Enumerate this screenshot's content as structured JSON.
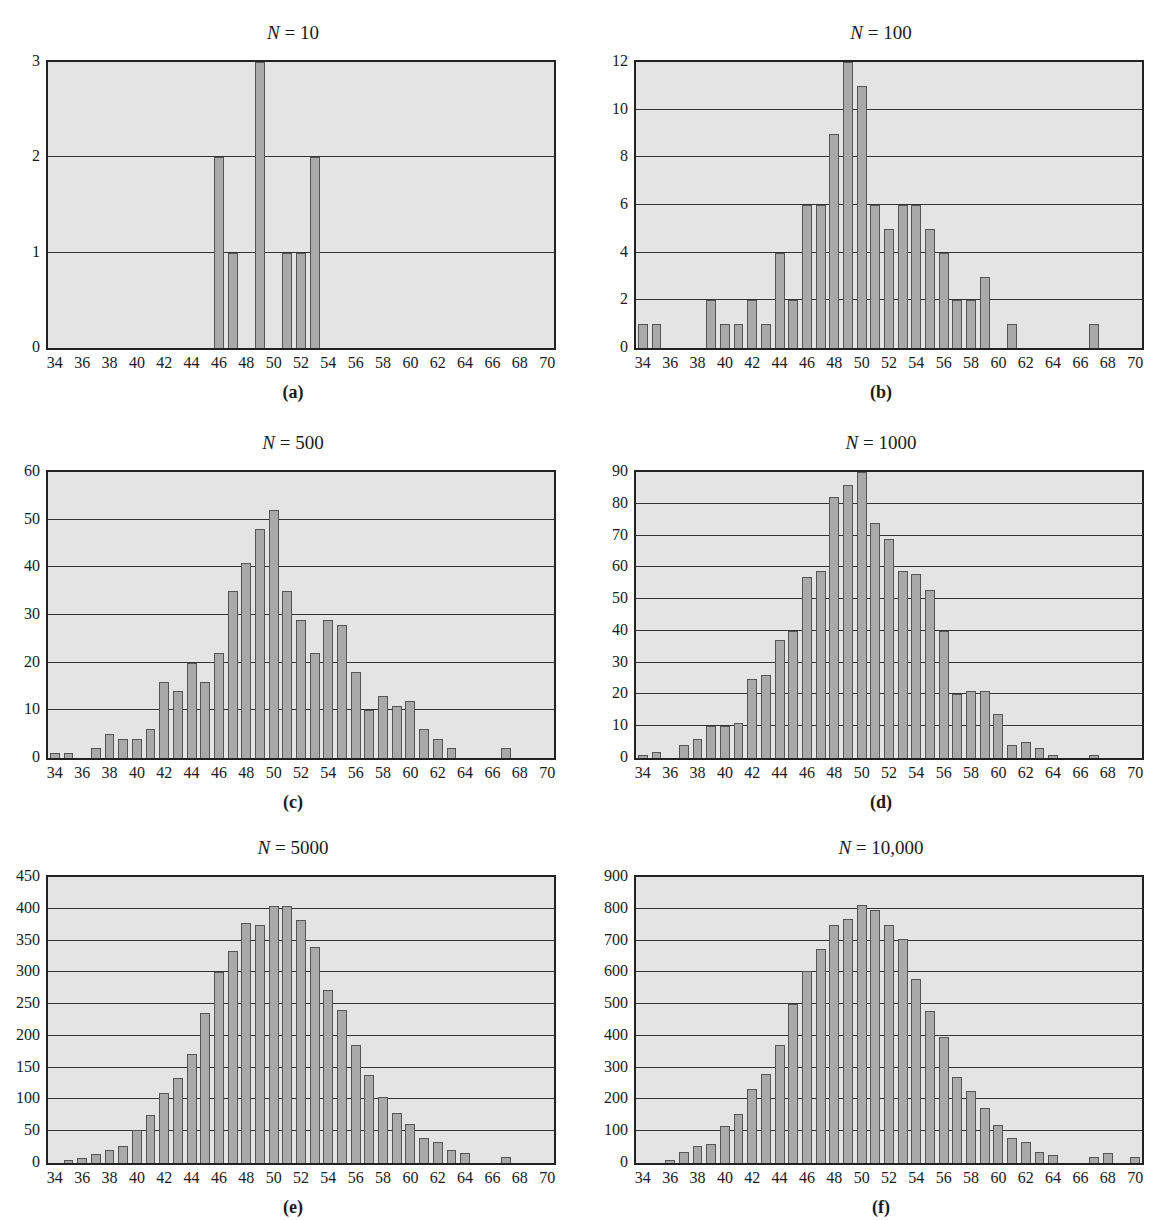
{
  "figure": {
    "panels": [
      {
        "id": "a",
        "label": "(a)",
        "title_var": "N",
        "title_val": "= 10"
      },
      {
        "id": "b",
        "label": "(b)",
        "title_var": "N",
        "title_val": "= 100"
      },
      {
        "id": "c",
        "label": "(c)",
        "title_var": "N",
        "title_val": "= 500"
      },
      {
        "id": "d",
        "label": "(d)",
        "title_var": "N",
        "title_val": "= 1000"
      },
      {
        "id": "e",
        "label": "(e)",
        "title_var": "N",
        "title_val": "= 5000"
      },
      {
        "id": "f",
        "label": "(f)",
        "title_var": "N",
        "title_val": "= 10,000"
      }
    ],
    "colors": {
      "plot_bg": "#e4e4e4",
      "bar_fill": "#a9a9a9",
      "bar_edge": "#555555",
      "grid": "#333333"
    }
  },
  "chart_data": [
    {
      "type": "bar",
      "panel": "(a)",
      "title": "N = 10",
      "xlabel": "",
      "ylabel": "",
      "x_ticks": [
        34,
        36,
        38,
        40,
        42,
        44,
        46,
        48,
        50,
        52,
        54,
        56,
        58,
        60,
        62,
        64,
        66,
        68,
        70
      ],
      "y_ticks": [
        0,
        1,
        2,
        3
      ],
      "ylim": [
        0,
        3
      ],
      "xlim": [
        33.5,
        70.5
      ],
      "grid": "horizontal",
      "categories": [
        46,
        47,
        49,
        51,
        52,
        53
      ],
      "values": [
        2,
        1,
        3,
        1,
        1,
        2
      ]
    },
    {
      "type": "bar",
      "panel": "(b)",
      "title": "N = 100",
      "xlabel": "",
      "ylabel": "",
      "x_ticks": [
        34,
        36,
        38,
        40,
        42,
        44,
        46,
        48,
        50,
        52,
        54,
        56,
        58,
        60,
        62,
        64,
        66,
        68,
        70
      ],
      "y_ticks": [
        0,
        2,
        4,
        6,
        8,
        10,
        12
      ],
      "ylim": [
        0,
        12
      ],
      "xlim": [
        33.5,
        70.5
      ],
      "grid": "horizontal",
      "categories": [
        34,
        35,
        39,
        40,
        41,
        42,
        43,
        44,
        45,
        46,
        47,
        48,
        49,
        50,
        51,
        52,
        53,
        54,
        55,
        56,
        57,
        58,
        59,
        61,
        67
      ],
      "values": [
        1,
        1,
        2,
        1,
        1,
        2,
        1,
        4,
        2,
        6,
        6,
        9,
        12,
        11,
        6,
        5,
        6,
        6,
        5,
        4,
        2,
        2,
        3,
        1,
        1
      ]
    },
    {
      "type": "bar",
      "panel": "(c)",
      "title": "N = 500",
      "xlabel": "",
      "ylabel": "",
      "x_ticks": [
        34,
        36,
        38,
        40,
        42,
        44,
        46,
        48,
        50,
        52,
        54,
        56,
        58,
        60,
        62,
        64,
        66,
        68,
        70
      ],
      "y_ticks": [
        0,
        10,
        20,
        30,
        40,
        50,
        60
      ],
      "ylim": [
        0,
        60
      ],
      "xlim": [
        33.5,
        70.5
      ],
      "grid": "horizontal",
      "categories": [
        34,
        35,
        37,
        38,
        39,
        40,
        41,
        42,
        43,
        44,
        45,
        46,
        47,
        48,
        49,
        50,
        51,
        52,
        53,
        54,
        55,
        56,
        57,
        58,
        59,
        60,
        61,
        62,
        63,
        67
      ],
      "values": [
        1,
        1,
        2,
        5,
        4,
        4,
        6,
        16,
        14,
        20,
        16,
        22,
        35,
        41,
        48,
        52,
        35,
        29,
        22,
        29,
        28,
        18,
        10,
        13,
        11,
        12,
        6,
        4,
        2,
        2
      ]
    },
    {
      "type": "bar",
      "panel": "(d)",
      "title": "N = 1000",
      "xlabel": "",
      "ylabel": "",
      "x_ticks": [
        34,
        36,
        38,
        40,
        42,
        44,
        46,
        48,
        50,
        52,
        54,
        56,
        58,
        60,
        62,
        64,
        66,
        68,
        70
      ],
      "y_ticks": [
        0,
        10,
        20,
        30,
        40,
        50,
        60,
        70,
        80,
        90
      ],
      "ylim": [
        0,
        90
      ],
      "xlim": [
        33.5,
        70.5
      ],
      "grid": "horizontal",
      "categories": [
        34,
        35,
        37,
        38,
        39,
        40,
        41,
        42,
        43,
        44,
        45,
        46,
        47,
        48,
        49,
        50,
        51,
        52,
        53,
        54,
        55,
        56,
        57,
        58,
        59,
        60,
        61,
        62,
        63,
        64,
        67
      ],
      "values": [
        1,
        2,
        4,
        6,
        10,
        10,
        11,
        25,
        26,
        37,
        40,
        57,
        59,
        82,
        86,
        90,
        74,
        69,
        59,
        58,
        53,
        40,
        20,
        21,
        21,
        14,
        4,
        5,
        3,
        1,
        1
      ]
    },
    {
      "type": "bar",
      "panel": "(e)",
      "title": "N = 5000",
      "xlabel": "",
      "ylabel": "",
      "x_ticks": [
        34,
        36,
        38,
        40,
        42,
        44,
        46,
        48,
        50,
        52,
        54,
        56,
        58,
        60,
        62,
        64,
        66,
        68,
        70
      ],
      "y_ticks": [
        0,
        50,
        100,
        150,
        200,
        250,
        300,
        350,
        400,
        450
      ],
      "ylim": [
        0,
        450
      ],
      "xlim": [
        33.5,
        70.5
      ],
      "grid": "horizontal",
      "categories": [
        35,
        36,
        37,
        38,
        39,
        40,
        41,
        42,
        43,
        44,
        45,
        46,
        47,
        48,
        49,
        50,
        51,
        52,
        53,
        54,
        55,
        56,
        57,
        58,
        59,
        60,
        61,
        62,
        63,
        64,
        67
      ],
      "values": [
        5,
        8,
        14,
        21,
        27,
        52,
        75,
        110,
        133,
        172,
        236,
        300,
        333,
        378,
        375,
        405,
        405,
        382,
        340,
        273,
        241,
        186,
        139,
        104,
        79,
        61,
        40,
        33,
        20,
        15,
        10
      ]
    },
    {
      "type": "bar",
      "panel": "(f)",
      "title": "N = 10,000",
      "xlabel": "",
      "ylabel": "",
      "x_ticks": [
        34,
        36,
        38,
        40,
        42,
        44,
        46,
        48,
        50,
        52,
        54,
        56,
        58,
        60,
        62,
        64,
        66,
        68,
        70
      ],
      "y_ticks": [
        0,
        100,
        200,
        300,
        400,
        500,
        600,
        700,
        800,
        900
      ],
      "ylim": [
        0,
        900
      ],
      "xlim": [
        33.5,
        70.5
      ],
      "grid": "horizontal",
      "categories": [
        36,
        37,
        38,
        39,
        40,
        41,
        42,
        43,
        44,
        45,
        46,
        47,
        48,
        49,
        50,
        51,
        52,
        53,
        54,
        55,
        56,
        57,
        58,
        59,
        60,
        61,
        62,
        63,
        64,
        67,
        68,
        70
      ],
      "values": [
        10,
        35,
        55,
        60,
        115,
        155,
        232,
        280,
        372,
        500,
        605,
        672,
        750,
        768,
        812,
        795,
        748,
        705,
        578,
        478,
        398,
        272,
        228,
        172,
        120,
        80,
        65,
        35,
        25,
        18,
        30,
        20
      ]
    }
  ]
}
